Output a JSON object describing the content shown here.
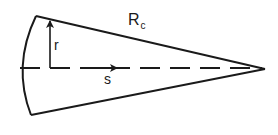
{
  "figure": {
    "type": "cone-section-diagram",
    "labels": {
      "radius_cone": "R",
      "radius_cone_subscript": "c",
      "radial_coordinate": "r",
      "axial_coordinate": "s"
    },
    "colors": {
      "stroke": "#1a1a1a",
      "background": "#ffffff"
    }
  }
}
